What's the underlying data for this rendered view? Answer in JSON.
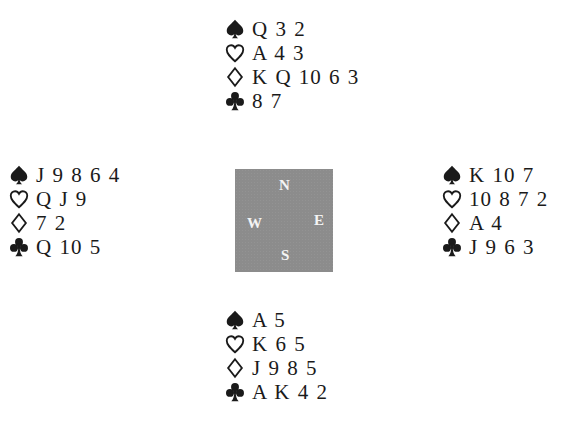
{
  "diagram": {
    "type": "bridge-deal",
    "hands": {
      "north": {
        "spades": "Q 3 2",
        "hearts": "A 4 3",
        "diamonds": "K Q 10 6 3",
        "clubs": "8 7"
      },
      "west": {
        "spades": "J 9 8 6 4",
        "hearts": "Q J 9",
        "diamonds": "7 2",
        "clubs": "Q 10 5"
      },
      "east": {
        "spades": "K 10 7",
        "hearts": "10 8 7 2",
        "diamonds": "A 4",
        "clubs": "J 9 6 3"
      },
      "south": {
        "spades": "A 5",
        "hearts": "K 6 5",
        "diamonds": "J 9 8 5",
        "clubs": "A K 4 2"
      }
    },
    "compass": {
      "north": "N",
      "west": "W",
      "east": "E",
      "south": "S",
      "background_color": "#8c8c8c",
      "letter_color": "#f4f4f4"
    },
    "suit_icons": {
      "spades": "spade-icon",
      "hearts": "heart-outline-icon",
      "diamonds": "diamond-outline-icon",
      "clubs": "club-icon"
    }
  }
}
